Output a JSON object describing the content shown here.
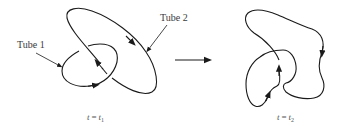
{
  "diagram": {
    "type": "vortex-tube-reconnection",
    "stroke_color": "#1a1a1a",
    "labels": {
      "tube1": "Tube 1",
      "tube2": "Tube 2"
    },
    "states": [
      {
        "id": "before",
        "time_var": "t",
        "equals": "=",
        "time_value": "t",
        "subscript": "1"
      },
      {
        "id": "after",
        "time_var": "t",
        "equals": "=",
        "time_value": "t",
        "subscript": "2"
      }
    ],
    "transition_arrow": "right-arrow"
  }
}
